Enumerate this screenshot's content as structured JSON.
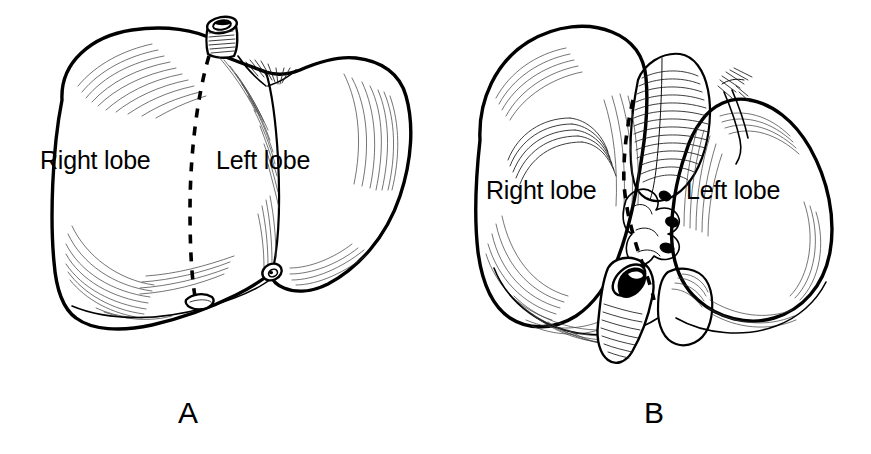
{
  "figure": {
    "type": "anatomical-line-illustration",
    "background_color": "#ffffff",
    "ink_color": "#000000",
    "width": 871,
    "height": 454
  },
  "panels": [
    {
      "id": "A",
      "letter": "A",
      "view": "anterior",
      "labels": {
        "right_lobe": "Right lobe",
        "left_lobe": "Left lobe"
      },
      "structures": [
        "inferior vena cava stump",
        "falciform ligament notch",
        "gallbladder fundus",
        "round ligament notch"
      ],
      "division_line": "dashed falciform division"
    },
    {
      "id": "B",
      "letter": "B",
      "view": "posteroinferior",
      "labels": {
        "right_lobe": "Right lobe",
        "left_lobe": "Left lobe"
      },
      "structures": [
        "caudate lobe",
        "porta hepatis",
        "gallbladder",
        "inferior vena cava groove",
        "bare area impression"
      ],
      "division_line": "dashed functional division"
    }
  ]
}
